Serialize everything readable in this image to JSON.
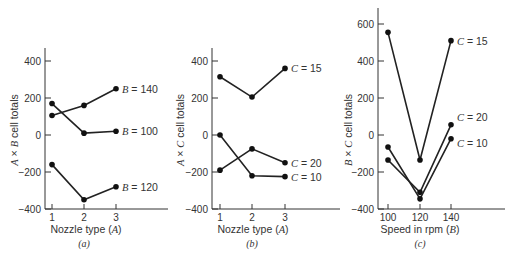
{
  "chart_data": [
    {
      "type": "line",
      "panel": "(a)",
      "title": "",
      "xlabel": "Nozzle type (A)",
      "ylabel": "A × B cell totals",
      "categories": [
        "1",
        "2",
        "3"
      ],
      "yticks": [
        400,
        200,
        0,
        -200,
        -400
      ],
      "ylim": [
        -400,
        450
      ],
      "series": [
        {
          "name": "B = 100",
          "values": [
            170,
            10,
            20
          ]
        },
        {
          "name": "B = 140",
          "values": [
            105,
            160,
            250
          ]
        },
        {
          "name": "B = 120",
          "values": [
            -160,
            -350,
            -280
          ]
        }
      ]
    },
    {
      "type": "line",
      "panel": "(b)",
      "title": "",
      "xlabel": "Nozzle type (A)",
      "ylabel": "A × C cell totals",
      "categories": [
        "1",
        "2",
        "3"
      ],
      "yticks": [
        400,
        200,
        0,
        -200,
        -400
      ],
      "ylim": [
        -400,
        450
      ],
      "series": [
        {
          "name": "C = 15",
          "values": [
            315,
            205,
            360
          ]
        },
        {
          "name": "C = 20",
          "values": [
            -190,
            -75,
            -150
          ]
        },
        {
          "name": "C = 10",
          "values": [
            0,
            -220,
            -225
          ]
        }
      ]
    },
    {
      "type": "line",
      "panel": "(c)",
      "title": "",
      "xlabel": "Speed in rpm (B)",
      "ylabel": "B × C cell totals",
      "categories": [
        "100",
        "120",
        "140"
      ],
      "yticks": [
        600,
        400,
        200,
        0,
        -200,
        -400
      ],
      "ylim": [
        -400,
        650
      ],
      "series": [
        {
          "name": "C = 15",
          "values": [
            555,
            -135,
            510
          ]
        },
        {
          "name": "C = 20",
          "values": [
            -135,
            -310,
            55
          ]
        },
        {
          "name": "C = 10",
          "values": [
            -65,
            -345,
            -20
          ]
        }
      ]
    }
  ],
  "panels": {
    "a": {
      "caption": "(a)",
      "xlabel": "Nozzle type (A)",
      "ylabel": "A × B cell totals"
    },
    "b": {
      "caption": "(b)",
      "xlabel": "Nozzle type (A)",
      "ylabel": "A × C cell totals"
    },
    "c": {
      "caption": "(c)",
      "xlabel": "Speed in rpm (B)",
      "ylabel": "B × C cell totals"
    }
  }
}
